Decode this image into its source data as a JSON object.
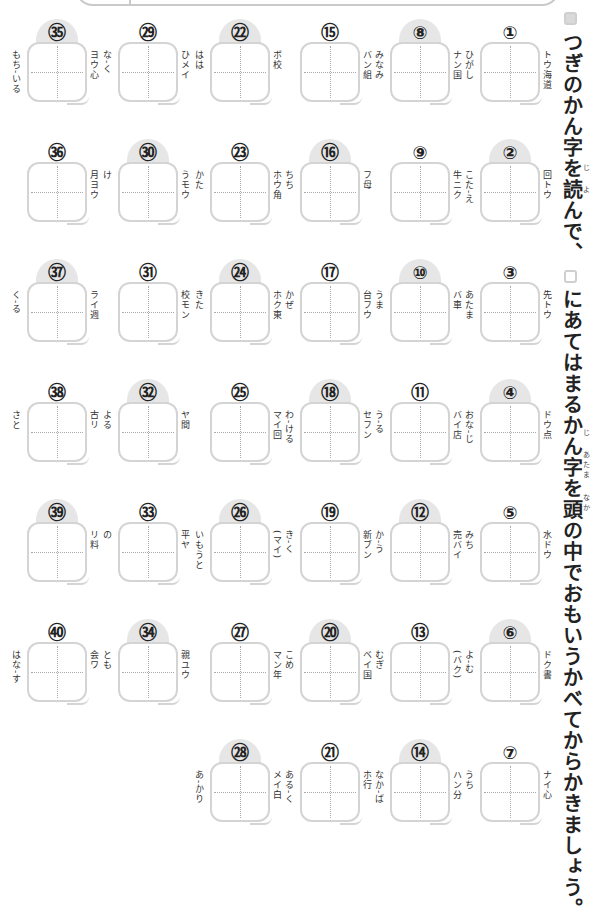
{
  "instructions": {
    "line1": "つぎのかん字を読んで、",
    "line2": "にあてはまるかん字を頭の中でおもいうかべてからかきましょう。",
    "ruby_ji_1": "じ",
    "ruby_yo": "よ",
    "ruby_ji_2": "じ",
    "ruby_atama": "あたま",
    "ruby_naka": "なか"
  },
  "items": [
    {
      "n": "①",
      "clue": "トウ海道",
      "reading": "ひがし"
    },
    {
      "n": "②",
      "clue": "回トウ",
      "reading": "こた-え"
    },
    {
      "n": "③",
      "clue": "先トウ",
      "reading": "あたま"
    },
    {
      "n": "④",
      "clue": "ドウ点",
      "reading": "おな-じ"
    },
    {
      "n": "⑤",
      "clue": "水ドウ",
      "reading": "みち"
    },
    {
      "n": "⑥",
      "clue": "ドク書",
      "reading": "よ-む"
    },
    {
      "n": "⑦",
      "clue": "ナイ心",
      "reading": "うち"
    },
    {
      "n": "⑧",
      "clue": "ナン国",
      "reading": "みなみ"
    },
    {
      "n": "⑨",
      "clue": "牛ニク",
      "reading": ""
    },
    {
      "n": "⑩",
      "clue": "バ車",
      "reading": "うま"
    },
    {
      "n": "⑪",
      "clue": "バイ店",
      "reading": "う-る"
    },
    {
      "n": "⑫",
      "clue": "売バイ",
      "reading": "か-う"
    },
    {
      "n": "⑬",
      "clue": "(バク)",
      "reading": "むぎ"
    },
    {
      "n": "⑭",
      "clue": "ハン分",
      "reading": "なか-ば"
    },
    {
      "n": "⑮",
      "clue": "バン組",
      "reading": ""
    },
    {
      "n": "⑯",
      "clue": "フ母",
      "reading": "ちち"
    },
    {
      "n": "⑰",
      "clue": "台フウ",
      "reading": "かぜ"
    },
    {
      "n": "⑱",
      "clue": "セフン",
      "reading": "わ-ける"
    },
    {
      "n": "⑲",
      "clue": "新ブン",
      "reading": "き-く"
    },
    {
      "n": "⑳",
      "clue": "ベイ国",
      "reading": "こめ"
    },
    {
      "n": "㉑",
      "clue": "ホ行",
      "reading": "ある-く"
    },
    {
      "n": "㉒",
      "clue": "ボ校",
      "reading": "はは"
    },
    {
      "n": "㉓",
      "clue": "ホウ角",
      "reading": "かた"
    },
    {
      "n": "㉔",
      "clue": "ホク東",
      "reading": "きた"
    },
    {
      "n": "㉕",
      "clue": "マイ回",
      "reading": ""
    },
    {
      "n": "㉖",
      "clue": "(マイ)",
      "reading": "いもうと"
    },
    {
      "n": "㉗",
      "clue": "マン年",
      "reading": ""
    },
    {
      "n": "㉘",
      "clue": "メイ白",
      "reading": "あ-かり"
    },
    {
      "n": "㉙",
      "clue": "ひメイ",
      "reading": "な-く"
    },
    {
      "n": "㉚",
      "clue": "うモウ",
      "reading": "け"
    },
    {
      "n": "㉛",
      "clue": "校モン",
      "reading": ""
    },
    {
      "n": "㉜",
      "clue": "ヤ間",
      "reading": "よる"
    },
    {
      "n": "㉝",
      "clue": "平ヤ",
      "reading": "の"
    },
    {
      "n": "㉞",
      "clue": "親ユウ",
      "reading": "とも"
    },
    {
      "n": "㉟",
      "clue": "ヨウ心",
      "reading": "もち-いる"
    },
    {
      "n": "㊱",
      "clue": "月ヨウ",
      "reading": ""
    },
    {
      "n": "㊲",
      "clue": "ライ週",
      "reading": "く-る"
    },
    {
      "n": "㊳",
      "clue": "古リ",
      "reading": "さと"
    },
    {
      "n": "㊴",
      "clue": "リ料",
      "reading": ""
    },
    {
      "n": "㊵",
      "clue": "会ワ",
      "reading": "はな-す"
    }
  ]
}
